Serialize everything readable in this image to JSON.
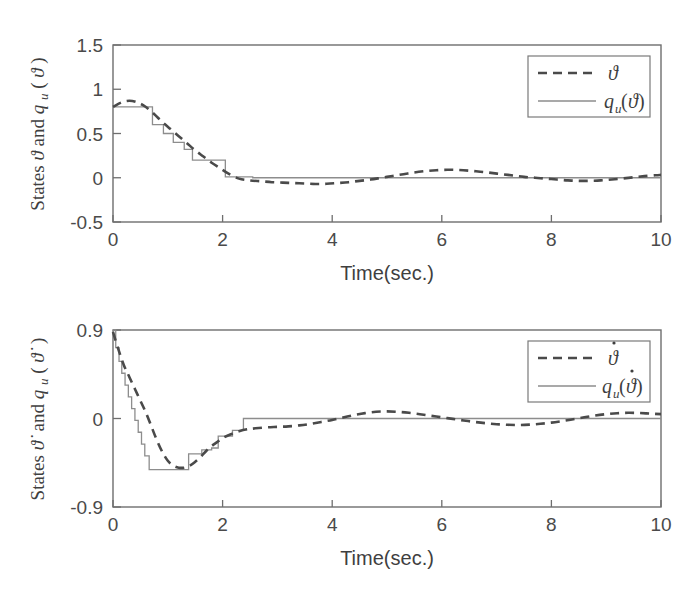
{
  "figure": {
    "background": "#ffffff",
    "line_colors": {
      "dashed_series": "#4a4a4a",
      "solid_series": "#8d8d8d",
      "axis": "#6e6e6e"
    }
  },
  "chart_data": [
    {
      "type": "line",
      "panel": "top",
      "title": "",
      "xlabel": "Time(sec.)",
      "ylabel": "States ϑ and q_u(ϑ)",
      "ylabel_parts": {
        "prefix": "States",
        "symbol1": "ϑ",
        "conjunction": "and",
        "symbol2_base": "q",
        "symbol2_sub": "u",
        "symbol2_arg": "ϑ"
      },
      "xlim": [
        0,
        10
      ],
      "ylim": [
        -0.5,
        1.5
      ],
      "xticks": [
        0,
        2,
        4,
        6,
        8,
        10
      ],
      "xtick_labels": [
        "0",
        "2",
        "4",
        "6",
        "8",
        "10"
      ],
      "yticks": [
        -0.5,
        0,
        0.5,
        1,
        1.5
      ],
      "ytick_labels": [
        "-0.5",
        "0",
        "0.5",
        "1",
        "1.5"
      ],
      "grid": false,
      "legend_position": "upper right",
      "series": [
        {
          "name": "ϑ",
          "label_parts": {
            "base": "ϑ",
            "sub": "",
            "dot": false,
            "arg": ""
          },
          "style": "dashed",
          "kind": "smooth",
          "x": [
            0.0,
            0.15,
            0.3,
            0.45,
            0.6,
            0.75,
            0.9,
            1.05,
            1.2,
            1.35,
            1.5,
            1.65,
            1.8,
            1.95,
            2.1,
            2.3,
            2.5,
            2.7,
            2.9,
            3.1,
            3.3,
            3.5,
            3.7,
            3.9,
            4.1,
            4.3,
            4.5,
            4.7,
            4.9,
            5.1,
            5.3,
            5.5,
            5.7,
            5.9,
            6.1,
            6.3,
            6.5,
            6.7,
            6.9,
            7.1,
            7.3,
            7.5,
            7.7,
            7.9,
            8.1,
            8.3,
            8.5,
            8.7,
            8.9,
            9.1,
            9.3,
            9.5,
            9.7,
            9.9,
            10.0
          ],
          "y": [
            0.8,
            0.85,
            0.87,
            0.85,
            0.8,
            0.72,
            0.63,
            0.55,
            0.47,
            0.39,
            0.31,
            0.24,
            0.17,
            0.11,
            0.05,
            -0.01,
            -0.03,
            -0.04,
            -0.05,
            -0.055,
            -0.06,
            -0.065,
            -0.07,
            -0.068,
            -0.06,
            -0.05,
            -0.035,
            -0.02,
            0.0,
            0.02,
            0.04,
            0.06,
            0.075,
            0.085,
            0.09,
            0.088,
            0.08,
            0.068,
            0.055,
            0.04,
            0.025,
            0.01,
            0.0,
            -0.01,
            -0.02,
            -0.03,
            -0.035,
            -0.035,
            -0.03,
            -0.02,
            -0.008,
            0.005,
            0.018,
            0.028,
            0.032
          ]
        },
        {
          "name": "q_u(ϑ)",
          "label_parts": {
            "base": "q",
            "sub": "u",
            "dot": false,
            "arg": "ϑ"
          },
          "style": "solid",
          "kind": "staircase",
          "x": [
            0.0,
            0.72,
            0.72,
            0.92,
            0.92,
            1.1,
            1.1,
            1.3,
            1.3,
            1.45,
            1.45,
            1.62,
            1.62,
            2.05,
            2.05,
            2.55,
            2.55,
            10.0
          ],
          "y": [
            0.8,
            0.8,
            0.6,
            0.6,
            0.5,
            0.5,
            0.4,
            0.4,
            0.32,
            0.32,
            0.2,
            0.2,
            0.2,
            0.2,
            0.01,
            0.01,
            0.0,
            0.0
          ]
        }
      ]
    },
    {
      "type": "line",
      "panel": "bottom",
      "title": "",
      "xlabel": "Time(sec.)",
      "ylabel": "States ϑ̇ and q_u(ϑ̇)",
      "ylabel_parts": {
        "prefix": "States",
        "symbol1": "ϑ",
        "conjunction": "and",
        "symbol2_base": "q",
        "symbol2_sub": "u",
        "symbol2_arg": "ϑ"
      },
      "xlim": [
        0,
        10
      ],
      "ylim": [
        -0.9,
        0.9
      ],
      "xticks": [
        0,
        2,
        4,
        6,
        8,
        10
      ],
      "xtick_labels": [
        "0",
        "2",
        "4",
        "6",
        "8",
        "10"
      ],
      "yticks": [
        -0.9,
        0,
        0.9
      ],
      "ytick_labels": [
        "-0.9",
        "0",
        "0.9"
      ],
      "grid": false,
      "legend_position": "upper right",
      "series": [
        {
          "name": "ϑ̇",
          "label_parts": {
            "base": "ϑ",
            "sub": "",
            "dot": true,
            "arg": ""
          },
          "style": "dashed",
          "kind": "smooth",
          "x": [
            0.0,
            0.1,
            0.2,
            0.3,
            0.4,
            0.5,
            0.6,
            0.7,
            0.8,
            0.9,
            1.0,
            1.1,
            1.2,
            1.3,
            1.4,
            1.5,
            1.6,
            1.7,
            1.8,
            1.9,
            2.0,
            2.15,
            2.3,
            2.45,
            2.6,
            2.8,
            3.0,
            3.2,
            3.4,
            3.6,
            3.8,
            4.0,
            4.2,
            4.4,
            4.6,
            4.8,
            5.0,
            5.2,
            5.4,
            5.6,
            5.8,
            6.0,
            6.2,
            6.4,
            6.6,
            6.8,
            7.0,
            7.2,
            7.4,
            7.6,
            7.8,
            8.0,
            8.2,
            8.4,
            8.6,
            8.8,
            9.0,
            9.2,
            9.4,
            9.6,
            9.8,
            10.0
          ],
          "y": [
            0.88,
            0.7,
            0.54,
            0.42,
            0.3,
            0.18,
            0.06,
            -0.08,
            -0.22,
            -0.34,
            -0.43,
            -0.48,
            -0.5,
            -0.5,
            -0.48,
            -0.44,
            -0.39,
            -0.33,
            -0.28,
            -0.24,
            -0.2,
            -0.16,
            -0.13,
            -0.11,
            -0.1,
            -0.09,
            -0.085,
            -0.08,
            -0.07,
            -0.055,
            -0.035,
            -0.015,
            0.01,
            0.035,
            0.055,
            0.068,
            0.072,
            0.068,
            0.058,
            0.044,
            0.028,
            0.012,
            -0.004,
            -0.02,
            -0.035,
            -0.048,
            -0.058,
            -0.064,
            -0.066,
            -0.062,
            -0.054,
            -0.042,
            -0.026,
            -0.008,
            0.012,
            0.03,
            0.044,
            0.054,
            0.058,
            0.056,
            0.05,
            0.044
          ]
        },
        {
          "name": "q_u(ϑ̇)",
          "label_parts": {
            "base": "q",
            "sub": "u",
            "dot": true,
            "arg": "ϑ"
          },
          "style": "solid",
          "kind": "staircase",
          "x": [
            0.0,
            0.05,
            0.05,
            0.11,
            0.11,
            0.16,
            0.16,
            0.22,
            0.22,
            0.28,
            0.28,
            0.34,
            0.34,
            0.4,
            0.4,
            0.46,
            0.46,
            0.52,
            0.52,
            0.58,
            0.58,
            0.66,
            0.66,
            1.38,
            1.38,
            1.62,
            1.62,
            1.8,
            1.8,
            1.92,
            1.92,
            2.18,
            2.18,
            2.38,
            2.38,
            10.0
          ],
          "y": [
            0.9,
            0.9,
            0.72,
            0.72,
            0.58,
            0.58,
            0.46,
            0.46,
            0.34,
            0.34,
            0.22,
            0.22,
            0.1,
            0.1,
            -0.02,
            -0.02,
            -0.14,
            -0.14,
            -0.26,
            -0.26,
            -0.38,
            -0.38,
            -0.52,
            -0.52,
            -0.36,
            -0.36,
            -0.32,
            -0.32,
            -0.3,
            -0.3,
            -0.18,
            -0.18,
            -0.12,
            -0.12,
            0.0,
            0.0
          ]
        }
      ]
    }
  ]
}
